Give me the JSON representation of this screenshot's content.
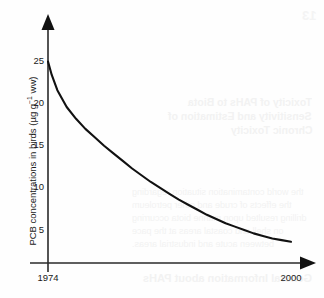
{
  "chart_data": {
    "type": "line",
    "title": "",
    "subtitle": "",
    "xlabel": "",
    "ylabel": "PCB concentrations in birds (µg g⁻¹ ww)",
    "ylabel_text": "PCB concentrations in birds (",
    "ylabel_unit_base": "µg g",
    "ylabel_unit_exp": "−1",
    "ylabel_unit_tail": " ww)",
    "x_tick_labels": [
      "1974",
      "2000"
    ],
    "x_tick_values": [
      1974,
      2000
    ],
    "y_tick_labels": [
      "25",
      "20",
      "15",
      "10",
      "5"
    ],
    "y_tick_values": [
      25,
      20,
      15,
      10,
      5
    ],
    "xlim": [
      1974,
      2000
    ],
    "ylim": [
      0,
      27
    ],
    "grid": false,
    "legend": "none",
    "axis_arrows": {
      "x": "right",
      "y": "up"
    },
    "series": [
      {
        "name": "PCB concentration in birds",
        "color": "#111111",
        "x": [
          1974,
          1974.4,
          1975,
          1976,
          1977,
          1978,
          1979,
          1980,
          1981,
          1982,
          1983,
          1984,
          1985,
          1986,
          1987,
          1988,
          1989,
          1990,
          1991,
          1992,
          1993,
          1994,
          1995,
          1996,
          1997,
          1998,
          1999,
          2000
        ],
        "values": [
          25.0,
          23.4,
          21.6,
          19.6,
          18.2,
          17.0,
          16.0,
          15.0,
          14.1,
          13.2,
          12.3,
          11.5,
          10.7,
          10.0,
          9.3,
          8.6,
          8.0,
          7.4,
          6.8,
          6.3,
          5.8,
          5.4,
          5.0,
          4.6,
          4.3,
          4.0,
          3.8,
          3.6
        ]
      }
    ],
    "annotations": []
  },
  "yaxis": {
    "ticks": [
      {
        "label": "25",
        "value": 25
      },
      {
        "label": "20",
        "value": 20
      },
      {
        "label": "15",
        "value": 15
      },
      {
        "label": "10",
        "value": 10
      },
      {
        "label": "5",
        "value": 5
      }
    ]
  },
  "xaxis": {
    "ticks": [
      {
        "label": "1974",
        "value": 1974
      },
      {
        "label": "2000",
        "value": 2000
      }
    ]
  },
  "bleed_through": {
    "page_number": "13",
    "heading_line_1": "Toxicity of PAHs to Biota",
    "heading_line_2": "Sensitivity and Estimation of",
    "heading_line_3": "Chronic Toxicity",
    "paragraph": "the world contamination situation regarding the effects of crude and other petroleum drilling resulted upon marine biota occurring on shell and coastal areas at the pace between acute and industrial areas.",
    "footer_heading": "General Information about PAHs"
  },
  "colors": {
    "curve": "#111111",
    "axis": "#2a2a2a",
    "text": "#1a1a1a",
    "background": "#fefefe",
    "bleed": "#f2f2f2"
  }
}
